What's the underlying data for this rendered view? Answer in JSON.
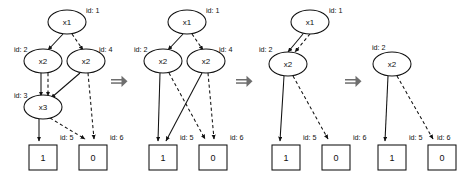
{
  "diagram": {
    "type": "binary-decision-diagram-reduction",
    "colors": {
      "background": "#ffffff",
      "stroke": "#111111",
      "arrow": "#6e6e6e"
    },
    "edge_styles": {
      "low": "dashed",
      "high": "solid"
    },
    "panels": [
      {
        "index": 1,
        "name": "panel-initial",
        "nodes": [
          {
            "id": "1",
            "label": "x1",
            "id_label": "id: 1",
            "shape": "ellipse",
            "cx": 67,
            "cy": 22,
            "rx": 19,
            "ry": 12,
            "id_x": 86,
            "id_y": 13
          },
          {
            "id": "2",
            "label": "x2",
            "id_label": "id: 2",
            "shape": "ellipse",
            "cx": 43,
            "cy": 61,
            "rx": 19,
            "ry": 12,
            "id_x": 14,
            "id_y": 52
          },
          {
            "id": "4",
            "label": "x2",
            "id_label": "id: 4",
            "shape": "ellipse",
            "cx": 86,
            "cy": 61,
            "rx": 19,
            "ry": 12,
            "id_x": 99,
            "id_y": 52
          },
          {
            "id": "3",
            "label": "x3",
            "id_label": "id: 3",
            "shape": "ellipse",
            "cx": 43,
            "cy": 107,
            "rx": 19,
            "ry": 12,
            "id_x": 14,
            "id_y": 98
          },
          {
            "id": "5",
            "label": "1",
            "id_label": "id: 5",
            "shape": "rect",
            "x": 29,
            "y": 145,
            "w": 28,
            "h": 25,
            "id_x": 60,
            "id_y": 140
          },
          {
            "id": "6",
            "label": "0",
            "id_label": "id: 6",
            "shape": "rect",
            "x": 79,
            "y": 145,
            "w": 28,
            "h": 25,
            "id_x": 110,
            "id_y": 140
          }
        ],
        "edges": [
          {
            "from": "1",
            "to": "2",
            "style": "solid",
            "path": "M 63 34 L 48 50"
          },
          {
            "from": "1",
            "to": "4",
            "style": "dashed",
            "path": "M 72 34 L 83 50"
          },
          {
            "from": "2",
            "to": "3",
            "style": "solid",
            "path": "M 41 73 L 41 96"
          },
          {
            "from": "2",
            "to": "3",
            "style": "dashed",
            "path": "M 48 73 L 48 96"
          },
          {
            "from": "4",
            "to": "3",
            "style": "solid",
            "path": "M 80 73 L 51 98"
          },
          {
            "from": "4",
            "to": "6",
            "style": "dashed",
            "path": "M 88 73 L 94 139"
          },
          {
            "from": "3",
            "to": "5",
            "style": "solid",
            "path": "M 39 119 L 39 141"
          },
          {
            "from": "3",
            "to": "6",
            "style": "dashed",
            "path": "M 50 118 L 85 139"
          }
        ]
      },
      {
        "index": 2,
        "name": "panel-after-x3-removed",
        "nodes": [
          {
            "id": "1",
            "label": "x1",
            "id_label": "id: 1",
            "shape": "ellipse",
            "cx": 187,
            "cy": 22,
            "rx": 19,
            "ry": 12,
            "id_x": 206,
            "id_y": 13
          },
          {
            "id": "2",
            "label": "x2",
            "id_label": "id: 2",
            "shape": "ellipse",
            "cx": 163,
            "cy": 61,
            "rx": 19,
            "ry": 12,
            "id_x": 134,
            "id_y": 52
          },
          {
            "id": "4",
            "label": "x2",
            "id_label": "id: 4",
            "shape": "ellipse",
            "cx": 206,
            "cy": 61,
            "rx": 19,
            "ry": 12,
            "id_x": 219,
            "id_y": 52
          },
          {
            "id": "5",
            "label": "1",
            "id_label": "id: 5",
            "shape": "rect",
            "x": 149,
            "y": 145,
            "w": 28,
            "h": 25,
            "id_x": 180,
            "id_y": 140
          },
          {
            "id": "6",
            "label": "0",
            "id_label": "id: 6",
            "shape": "rect",
            "x": 199,
            "y": 145,
            "w": 28,
            "h": 25,
            "id_x": 230,
            "id_y": 140
          }
        ],
        "edges": [
          {
            "from": "1",
            "to": "2",
            "style": "solid",
            "path": "M 183 34 L 168 50"
          },
          {
            "from": "1",
            "to": "4",
            "style": "dashed",
            "path": "M 192 34 L 203 50"
          },
          {
            "from": "2",
            "to": "5",
            "style": "solid",
            "path": "M 160 73 L 158 141"
          },
          {
            "from": "2",
            "to": "6",
            "style": "dashed",
            "path": "M 169 73 L 205 139"
          },
          {
            "from": "4",
            "to": "5",
            "style": "solid",
            "path": "M 202 73 L 166 141"
          },
          {
            "from": "4",
            "to": "6",
            "style": "dashed",
            "path": "M 208 73 L 214 139"
          }
        ]
      },
      {
        "index": 3,
        "name": "panel-after-x2-merged",
        "nodes": [
          {
            "id": "1",
            "label": "x1",
            "id_label": "id: 1",
            "shape": "ellipse",
            "cx": 310,
            "cy": 22,
            "rx": 19,
            "ry": 12,
            "id_x": 329,
            "id_y": 13
          },
          {
            "id": "2",
            "label": "x2",
            "id_label": "id: 2",
            "shape": "ellipse",
            "cx": 288,
            "cy": 64,
            "rx": 19,
            "ry": 12,
            "id_x": 259,
            "id_y": 52
          },
          {
            "id": "5",
            "label": "1",
            "id_label": "id: 5",
            "shape": "rect",
            "x": 272,
            "y": 145,
            "w": 28,
            "h": 25,
            "id_x": 303,
            "id_y": 140
          },
          {
            "id": "6",
            "label": "0",
            "id_label": "id: 6",
            "shape": "rect",
            "x": 322,
            "y": 145,
            "w": 28,
            "h": 25,
            "id_x": 353,
            "id_y": 140
          }
        ],
        "edges": [
          {
            "from": "1",
            "to": "2",
            "style": "solid",
            "path": "M 303 34 L 288 52"
          },
          {
            "from": "1",
            "to": "2",
            "style": "dashed",
            "path": "M 310 34 L 295 52"
          },
          {
            "from": "2",
            "to": "5",
            "style": "solid",
            "path": "M 284 76 L 280 141"
          },
          {
            "from": "2",
            "to": "6",
            "style": "dashed",
            "path": "M 293 76 L 328 139"
          }
        ]
      },
      {
        "index": 4,
        "name": "panel-after-x1-removed",
        "nodes": [
          {
            "id": "2",
            "label": "x2",
            "id_label": "id: 2",
            "shape": "ellipse",
            "cx": 392,
            "cy": 64,
            "rx": 19,
            "ry": 12,
            "id_x": 372,
            "id_y": 50
          },
          {
            "id": "5",
            "label": "1",
            "id_label": "id: 5",
            "shape": "rect",
            "x": 378,
            "y": 145,
            "w": 28,
            "h": 25,
            "id_x": 409,
            "id_y": 140
          },
          {
            "id": "6",
            "label": "0",
            "id_label": "id: 6",
            "shape": "rect",
            "x": 428,
            "y": 145,
            "w": 28,
            "h": 25,
            "id_x": 437,
            "id_y": 140
          }
        ],
        "edges": [
          {
            "from": "2",
            "to": "5",
            "style": "solid",
            "path": "M 388 76 L 385 141"
          },
          {
            "from": "2",
            "to": "6",
            "style": "dashed",
            "path": "M 397 76 L 433 139"
          }
        ]
      }
    ],
    "transform_arrows": [
      {
        "name": "transform-arrow-1",
        "x": 111,
        "y": 82
      },
      {
        "name": "transform-arrow-2",
        "x": 236,
        "y": 82
      },
      {
        "name": "transform-arrow-3",
        "x": 345,
        "y": 82
      }
    ]
  }
}
